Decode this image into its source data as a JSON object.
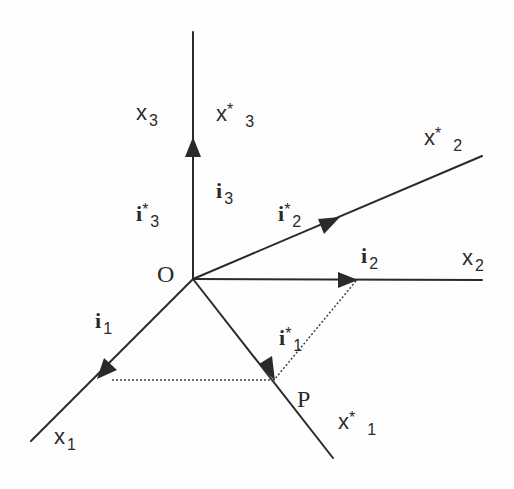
{
  "diagram": {
    "type": "coordinate-frame-rotation",
    "origin": {
      "label": "O",
      "x": 193,
      "y": 279
    },
    "point": {
      "label": "P",
      "x": 274,
      "y": 380
    },
    "colors": {
      "line": "#2a2a2a",
      "dotted": "#444444",
      "background": "#fefefe"
    },
    "axes": [
      {
        "id": "x3",
        "label": "x",
        "sub": "3",
        "star": "",
        "end": [
          193,
          32
        ]
      },
      {
        "id": "x3s",
        "label": "x",
        "sub": "3",
        "star": "*",
        "end": [
          193,
          32
        ]
      },
      {
        "id": "x2",
        "label": "x",
        "sub": "2",
        "star": "",
        "end": [
          482,
          280
        ]
      },
      {
        "id": "x2s",
        "label": "x",
        "sub": "2",
        "star": "*",
        "end": [
          482,
          156
        ]
      },
      {
        "id": "x1",
        "label": "x",
        "sub": "1",
        "star": "",
        "end": [
          31,
          441
        ]
      },
      {
        "id": "x1s",
        "label": "x",
        "sub": "1",
        "star": "*",
        "end": [
          333,
          458
        ]
      }
    ],
    "unit_vectors": [
      {
        "id": "i3",
        "label": "i",
        "sub": "3",
        "star": "",
        "tip": [
          193,
          137
        ]
      },
      {
        "id": "i3s",
        "label": "i",
        "sub": "3",
        "star": "*",
        "tip": [
          193,
          137
        ]
      },
      {
        "id": "i2",
        "label": "i",
        "sub": "2",
        "star": "",
        "tip": [
          357,
          280
        ]
      },
      {
        "id": "i2s",
        "label": "i",
        "sub": "2",
        "star": "*",
        "tip": [
          338,
          218
        ]
      },
      {
        "id": "i1",
        "label": "i",
        "sub": "1",
        "star": "",
        "tip": [
          99,
          378
        ]
      },
      {
        "id": "i1s",
        "label": "i",
        "sub": "1",
        "star": "*",
        "tip": [
          274,
          380
        ]
      }
    ],
    "projection_lines": [
      {
        "from": [
          112,
          380
        ],
        "to": [
          274,
          380
        ]
      },
      {
        "from": [
          356,
          281
        ],
        "to": [
          274,
          380
        ]
      }
    ],
    "labels": {
      "O": "O",
      "P": "P",
      "x": "x",
      "i": "i",
      "star": "*",
      "s1": "1",
      "s2": "2",
      "s3": "3"
    }
  }
}
